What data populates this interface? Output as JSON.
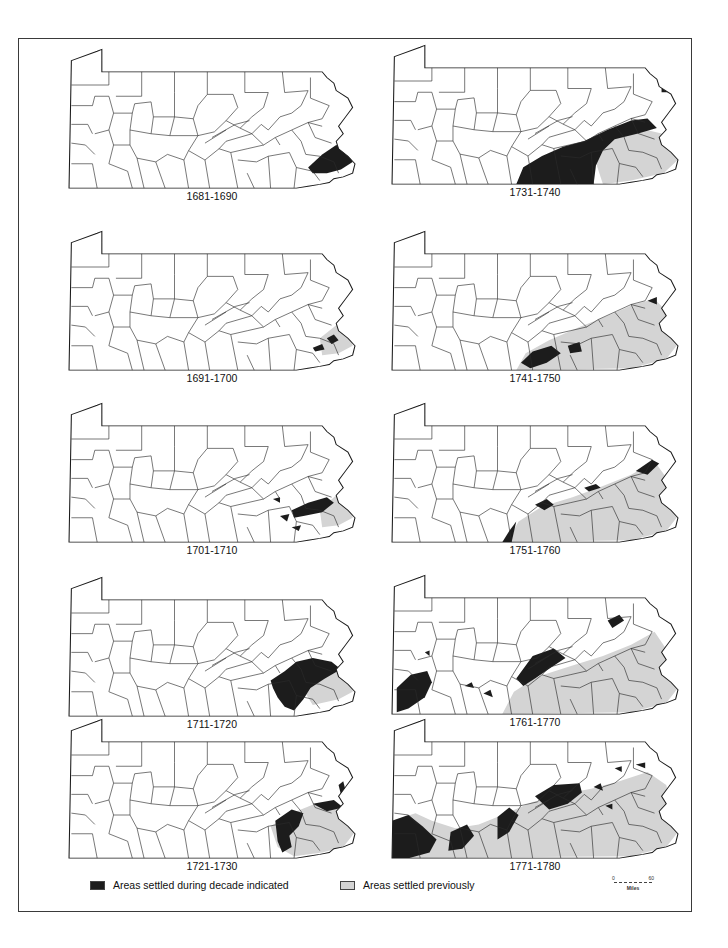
{
  "figure": {
    "title": "",
    "colors": {
      "settled_during_decade": "#1c1c1c",
      "settled_previously": "#d4d4d4",
      "unsettled": "#ffffff",
      "county_lines": "#2a2a2a"
    }
  },
  "panels": [
    {
      "label": "1681-1690",
      "column": "left",
      "row": 1
    },
    {
      "label": "1691-1700",
      "column": "left",
      "row": 2
    },
    {
      "label": "1701-1710",
      "column": "left",
      "row": 3
    },
    {
      "label": "1711-1720",
      "column": "left",
      "row": 4
    },
    {
      "label": "1721-1730",
      "column": "left",
      "row": 5
    },
    {
      "label": "1731-1740",
      "column": "right",
      "row": 1
    },
    {
      "label": "1741-1750",
      "column": "right",
      "row": 2
    },
    {
      "label": "1751-1760",
      "column": "right",
      "row": 3
    },
    {
      "label": "1761-1770",
      "column": "right",
      "row": 4
    },
    {
      "label": "1771-1780",
      "column": "right",
      "row": 5
    }
  ],
  "legend": {
    "during": "Areas settled during decade indicated",
    "previously": "Areas settled previously"
  },
  "scale_bar": {
    "start": "0",
    "end": "60",
    "unit": "Miles"
  }
}
